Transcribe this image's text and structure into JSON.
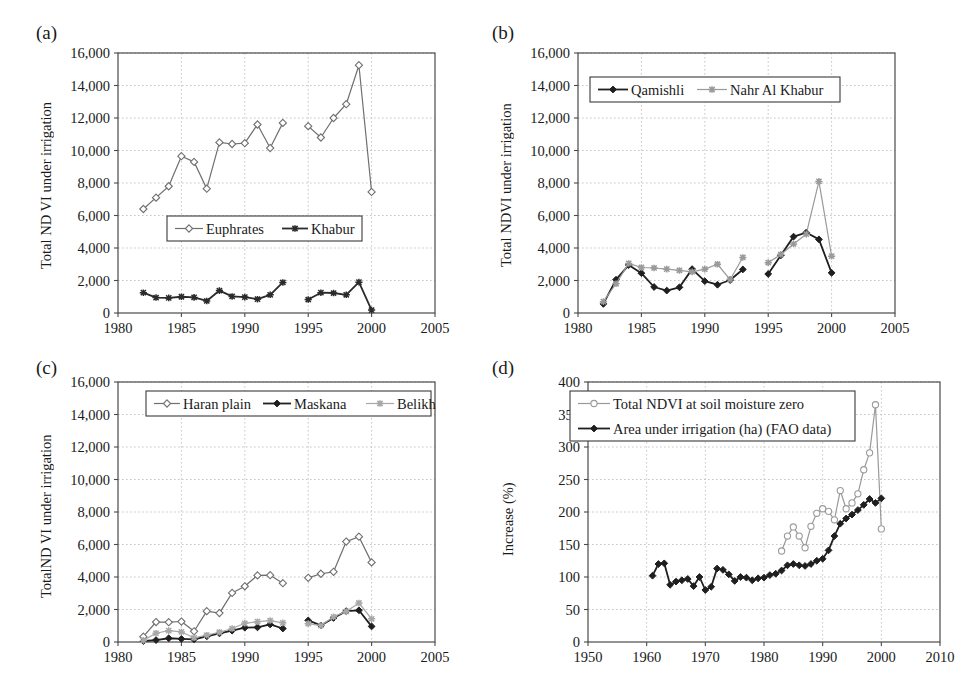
{
  "figure": {
    "panels": [
      {
        "key": "a",
        "label": "(a)"
      },
      {
        "key": "b",
        "label": "(b)"
      },
      {
        "key": "c",
        "label": "(c)"
      },
      {
        "key": "d",
        "label": "(d)"
      }
    ]
  },
  "chart_data": [
    {
      "panel": "a",
      "type": "line",
      "title": "",
      "xlabel": "",
      "ylabel": "Total ND VI under irrigation",
      "xlim": [
        1980,
        2005
      ],
      "ylim": [
        0,
        16000
      ],
      "xticks": [
        1980,
        1985,
        1990,
        1995,
        2000,
        2005
      ],
      "xticklabels": [
        "1980",
        "1985",
        "1990",
        "1995",
        "2000",
        "2005"
      ],
      "yticks": [
        0,
        2000,
        4000,
        6000,
        8000,
        10000,
        12000,
        14000,
        16000
      ],
      "yticklabels": [
        "0",
        "2,000",
        "4,000",
        "6,000",
        "8,000",
        "10,000",
        "12,000",
        "14,000",
        "16,000"
      ],
      "grid": true,
      "legend_position": "lower-center",
      "series": [
        {
          "name": "Euphrates",
          "color": "#6f6f6f",
          "marker": "open-diamond",
          "segments": [
            {
              "x": [
                1982,
                1983,
                1984,
                1985,
                1986,
                1987,
                1988,
                1989,
                1990,
                1991,
                1992,
                1993
              ],
              "y": [
                6400,
                7100,
                7800,
                9650,
                9300,
                7650,
                10500,
                10400,
                10450,
                11600,
                10150,
                11700
              ]
            },
            {
              "x": [
                1995,
                1996,
                1997,
                1998,
                1999,
                2000
              ],
              "y": [
                11500,
                10800,
                12000,
                12850,
                15250,
                7450
              ]
            }
          ]
        },
        {
          "name": "Khabur",
          "color": "#2b2b2b",
          "marker": "star",
          "segments": [
            {
              "x": [
                1982,
                1983,
                1984,
                1985,
                1986,
                1987,
                1988,
                1989,
                1990,
                1991,
                1992,
                1993
              ],
              "y": [
                1250,
                950,
                930,
                1000,
                960,
                740,
                1380,
                1020,
                980,
                850,
                1120,
                1880
              ]
            },
            {
              "x": [
                1995,
                1996,
                1997,
                1998,
                1999,
                2000
              ],
              "y": [
                830,
                1250,
                1230,
                1120,
                1900,
                180
              ]
            }
          ]
        }
      ]
    },
    {
      "panel": "b",
      "type": "line",
      "title": "",
      "xlabel": "",
      "ylabel": "Total NDVI under irrigation",
      "xlim": [
        1980,
        2005
      ],
      "ylim": [
        0,
        16000
      ],
      "xticks": [
        1980,
        1985,
        1990,
        1995,
        2000,
        2005
      ],
      "xticklabels": [
        "1980",
        "1985",
        "1990",
        "1995",
        "2000",
        "2005"
      ],
      "yticks": [
        0,
        2000,
        4000,
        6000,
        8000,
        10000,
        12000,
        14000,
        16000
      ],
      "yticklabels": [
        "0",
        "2,000",
        "4,000",
        "6,000",
        "8,000",
        "10,000",
        "12,000",
        "14,000",
        "16,000"
      ],
      "grid": true,
      "legend_position": "upper-left",
      "series": [
        {
          "name": "Qamishli",
          "color": "#1f1f1f",
          "marker": "filled-diamond",
          "segments": [
            {
              "x": [
                1982,
                1983,
                1984,
                1985,
                1986,
                1987,
                1988,
                1989,
                1990,
                1991,
                1992,
                1993
              ],
              "y": [
                560,
                2050,
                2950,
                2450,
                1600,
                1380,
                1580,
                2700,
                1960,
                1740,
                2030,
                2680
              ]
            },
            {
              "x": [
                1995,
                1996,
                1997,
                1998,
                1999,
                2000
              ],
              "y": [
                2400,
                3550,
                4700,
                4950,
                4530,
                2470
              ]
            }
          ]
        },
        {
          "name": "Nahr Al Khabur",
          "color": "#9a9a9a",
          "marker": "star",
          "segments": [
            {
              "x": [
                1982,
                1983,
                1984,
                1985,
                1986,
                1987,
                1988,
                1989,
                1990,
                1991,
                1992,
                1993
              ],
              "y": [
                700,
                1800,
                3050,
                2800,
                2770,
                2700,
                2620,
                2530,
                2700,
                3000,
                2060,
                3420
              ]
            },
            {
              "x": [
                1995,
                1996,
                1997,
                1998,
                1999,
                2000
              ],
              "y": [
                3100,
                3600,
                4250,
                4850,
                8100,
                3500
              ]
            }
          ]
        }
      ]
    },
    {
      "panel": "c",
      "type": "line",
      "title": "",
      "xlabel": "",
      "ylabel": "TotalND VI under irrigation",
      "xlim": [
        1980,
        2005
      ],
      "ylim": [
        0,
        16000
      ],
      "xticks": [
        1980,
        1985,
        1990,
        1995,
        2000,
        2005
      ],
      "xticklabels": [
        "1980",
        "1985",
        "1990",
        "1995",
        "2000",
        "2005"
      ],
      "yticks": [
        0,
        2000,
        4000,
        6000,
        8000,
        10000,
        12000,
        14000,
        16000
      ],
      "yticklabels": [
        "0",
        "2,000",
        "4,000",
        "6,000",
        "8,000",
        "10,000",
        "12,000",
        "14,000",
        "16,000"
      ],
      "grid": true,
      "legend_position": "upper-center",
      "series": [
        {
          "name": "Haran plain",
          "color": "#6f6f6f",
          "marker": "open-diamond",
          "segments": [
            {
              "x": [
                1982,
                1983,
                1984,
                1985,
                1986,
                1987,
                1988,
                1989,
                1990,
                1991,
                1992,
                1993
              ],
              "y": [
                330,
                1230,
                1220,
                1260,
                660,
                1900,
                1780,
                3020,
                3430,
                4100,
                4110,
                3620
              ]
            },
            {
              "x": [
                1995,
                1996,
                1997,
                1998,
                1999,
                2000
              ],
              "y": [
                3950,
                4200,
                4320,
                6180,
                6480,
                4900
              ]
            }
          ]
        },
        {
          "name": "Maskana",
          "color": "#1f1f1f",
          "marker": "filled-diamond",
          "segments": [
            {
              "x": [
                1982,
                1983,
                1984,
                1985,
                1986,
                1987,
                1988,
                1989,
                1990,
                1991,
                1992,
                1993
              ],
              "y": [
                60,
                120,
                230,
                190,
                160,
                350,
                530,
                700,
                880,
                900,
                1080,
                830
              ]
            },
            {
              "x": [
                1995,
                1996,
                1997,
                1998,
                1999,
                2000
              ],
              "y": [
                1330,
                1020,
                1480,
                1900,
                1950,
                960
              ]
            }
          ]
        },
        {
          "name": "Belikh",
          "color": "#a8a8a8",
          "marker": "star",
          "segments": [
            {
              "x": [
                1982,
                1983,
                1984,
                1985,
                1986,
                1987,
                1988,
                1989,
                1990,
                1991,
                1992,
                1993
              ],
              "y": [
                100,
                540,
                700,
                620,
                260,
                420,
                600,
                830,
                1150,
                1250,
                1320,
                1180
              ]
            },
            {
              "x": [
                1995,
                1996,
                1997,
                1998,
                1999,
                2000
              ],
              "y": [
                1130,
                1010,
                1550,
                1880,
                2400,
                1430
              ]
            }
          ]
        }
      ]
    },
    {
      "panel": "d",
      "type": "line",
      "title": "",
      "xlabel": "",
      "ylabel": "Increase (%)",
      "xlim": [
        1950,
        2010
      ],
      "ylim": [
        0,
        400
      ],
      "xticks": [
        1950,
        1960,
        1970,
        1980,
        1990,
        2000,
        2010
      ],
      "xticklabels": [
        "1950",
        "1960",
        "1970",
        "1980",
        "1990",
        "2000",
        "2010"
      ],
      "yticks": [
        0,
        50,
        100,
        150,
        200,
        250,
        300,
        350,
        400
      ],
      "yticklabels": [
        "0",
        "50",
        "100",
        "150",
        "200",
        "250",
        "300",
        "350",
        "400"
      ],
      "grid": true,
      "legend_position": "upper-left",
      "series": [
        {
          "name": "Total NDVI at soil moisture zero",
          "color": "#9a9a9a",
          "marker": "open-circle",
          "segments": [
            {
              "x": [
                1983,
                1984,
                1985,
                1986,
                1987,
                1988,
                1989,
                1990,
                1991,
                1992,
                1993,
                1994,
                1995,
                1996,
                1997,
                1998,
                1999,
                2000
              ],
              "y": [
                140,
                163,
                177,
                163,
                145,
                178,
                198,
                205,
                201,
                188,
                233,
                205,
                214,
                228,
                265,
                291,
                365,
                174
              ]
            }
          ]
        },
        {
          "name": "Area under irrigation (ha) (FAO data)",
          "color": "#1f1f1f",
          "marker": "filled-diamond",
          "segments": [
            {
              "x": [
                1961,
                1962,
                1963,
                1964,
                1965,
                1966,
                1967,
                1968,
                1969,
                1970,
                1971,
                1972,
                1973,
                1974,
                1975,
                1976,
                1977,
                1978,
                1979,
                1980,
                1981,
                1982,
                1983,
                1984,
                1985,
                1986,
                1987,
                1988,
                1989,
                1990,
                1991,
                1992,
                1993,
                1994,
                1995,
                1996,
                1997,
                1998,
                1999,
                2000
              ],
              "y": [
                102,
                120,
                121,
                88,
                93,
                95,
                97,
                86,
                100,
                80,
                85,
                113,
                111,
                104,
                94,
                100,
                99,
                95,
                98,
                99,
                103,
                105,
                110,
                118,
                120,
                118,
                117,
                120,
                125,
                128,
                141,
                163,
                182,
                190,
                196,
                203,
                211,
                220,
                214,
                221
              ]
            }
          ]
        }
      ]
    }
  ]
}
